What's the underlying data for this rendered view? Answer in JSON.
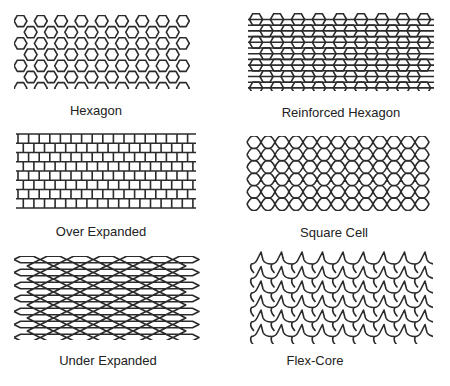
{
  "figure": {
    "background": "#ffffff",
    "line_color": "#2b2b2b",
    "panels": [
      {
        "id": "hexagon",
        "label": "Hexagon"
      },
      {
        "id": "reinforced-hexagon",
        "label": "Reinforced Hexagon"
      },
      {
        "id": "over-expanded",
        "label": "Over Expanded"
      },
      {
        "id": "square-cell",
        "label": "Square Cell"
      },
      {
        "id": "under-expanded",
        "label": "Under Expanded"
      },
      {
        "id": "flex-core",
        "label": "Flex-Core"
      }
    ]
  }
}
